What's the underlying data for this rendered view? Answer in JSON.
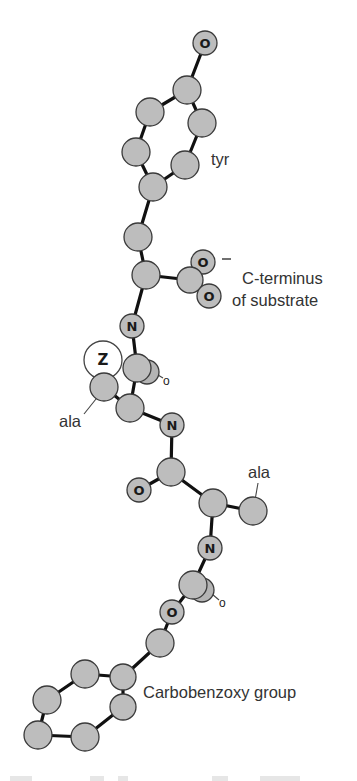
{
  "figure": {
    "colors": {
      "atom_fill": "#bdbdbd",
      "atom_stroke": "#3a3a3a",
      "bond": "#111111",
      "text": "#333333",
      "z_fill": "#ffffff"
    },
    "labels": {
      "tyr": "tyr",
      "c_terminus_line1": "C-terminus",
      "c_terminus_line2": "of substrate",
      "ala_upper": "ala",
      "ala_lower": "ala",
      "carbobenzoxy": "Carbobenzoxy group",
      "charge": "−"
    },
    "atom_symbols": {
      "oxygen": "O",
      "nitrogen": "N",
      "zinc": "Z",
      "carbonyl_o_small": "o"
    },
    "residues": [
      {
        "name": "tyr",
        "role": "C-terminal residue"
      },
      {
        "name": "ala",
        "role": "middle residue"
      },
      {
        "name": "ala",
        "role": "N-terminal residue"
      },
      {
        "name": "Carbobenzoxy group",
        "role": "N-terminal blocking group"
      }
    ]
  }
}
